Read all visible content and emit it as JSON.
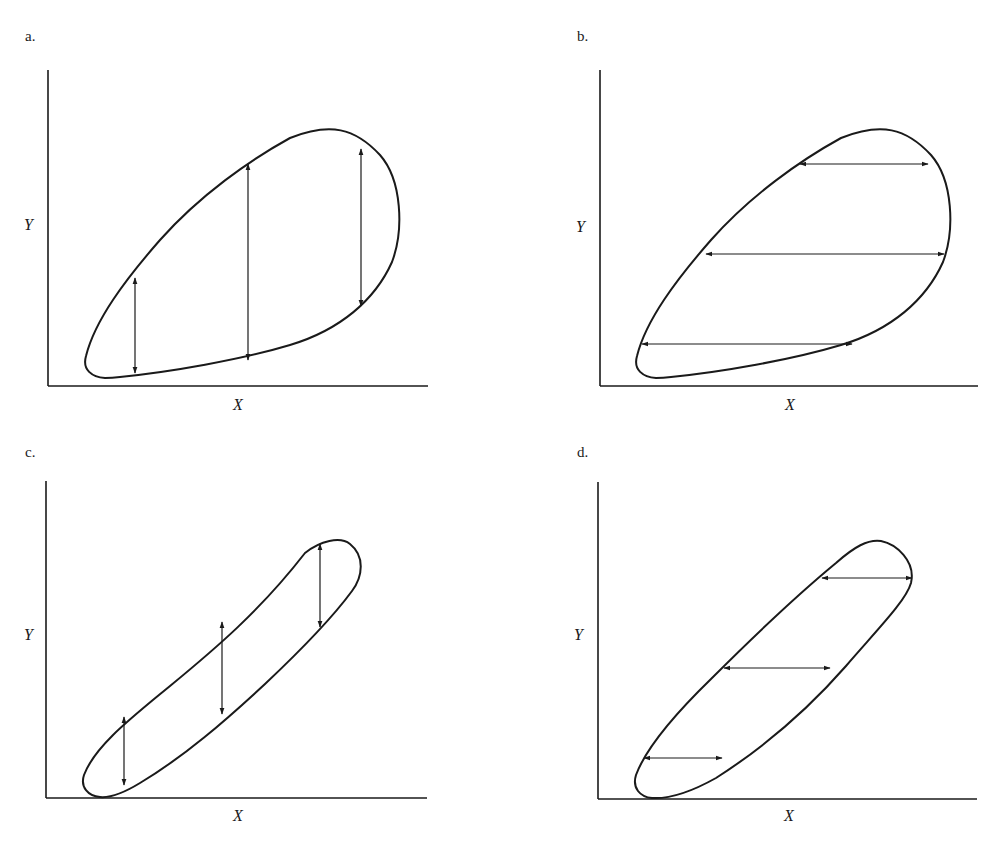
{
  "figure": {
    "panels": [
      {
        "id": "a",
        "label": "a.",
        "x_axis_label": "X",
        "y_axis_label": "Y",
        "shape": "wide-teardrop",
        "arrow_direction": "vertical",
        "arrow_count": 3
      },
      {
        "id": "b",
        "label": "b.",
        "x_axis_label": "X",
        "y_axis_label": "Y",
        "shape": "wide-teardrop",
        "arrow_direction": "horizontal",
        "arrow_count": 3
      },
      {
        "id": "c",
        "label": "c.",
        "x_axis_label": "X",
        "y_axis_label": "Y",
        "shape": "narrow-ellipse",
        "arrow_direction": "vertical",
        "arrow_count": 3
      },
      {
        "id": "d",
        "label": "d.",
        "x_axis_label": "X",
        "y_axis_label": "Y",
        "shape": "narrow-ellipse",
        "arrow_direction": "horizontal",
        "arrow_count": 3
      }
    ]
  },
  "colors": {
    "ink": "#1a1a1a",
    "background": "#ffffff"
  }
}
